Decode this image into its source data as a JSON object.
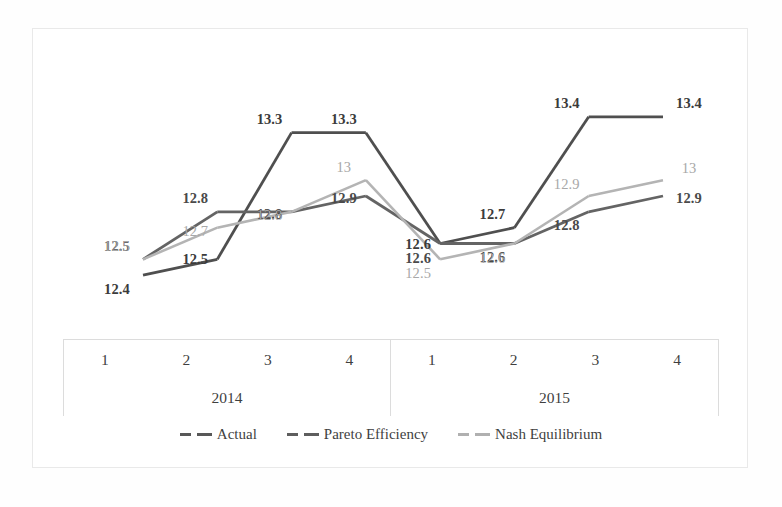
{
  "chart_data": {
    "type": "line",
    "title": "",
    "subtitle": "",
    "xlabel": "",
    "ylabel": "",
    "grid": false,
    "legend_position": "bottom",
    "categories": [
      "1",
      "2",
      "3",
      "4",
      "1",
      "2",
      "3",
      "4"
    ],
    "groups": [
      {
        "label": "2014",
        "quarters": [
          "1",
          "2",
          "3",
          "4"
        ]
      },
      {
        "label": "2015",
        "quarters": [
          "1",
          "2",
          "3",
          "4"
        ]
      }
    ],
    "ylim": [
      12.3,
      13.5
    ],
    "series": [
      {
        "name": "Actual",
        "color": "#4f4f4f",
        "values": [
          12.4,
          12.5,
          13.3,
          13.3,
          12.6,
          12.7,
          13.4,
          13.4
        ],
        "labels": [
          "12.4",
          "12.5",
          "13.3",
          "13.3",
          "12.6",
          "12.7",
          "13.4",
          "13.4"
        ]
      },
      {
        "name": "Pareto Efficiency",
        "color": "#646464",
        "values": [
          12.5,
          12.8,
          12.8,
          12.9,
          12.6,
          12.6,
          12.8,
          12.9
        ],
        "labels": [
          "12.5",
          "12.8",
          "12.8",
          "12.9",
          "12.6",
          "12.6",
          "12.8",
          "12.9"
        ]
      },
      {
        "name": "Nash Equilibrium",
        "color": "#b4b4b4",
        "values": [
          12.5,
          12.7,
          12.8,
          13.0,
          12.5,
          12.6,
          12.9,
          13.0
        ],
        "labels": [
          "12.5",
          "12.7",
          "12.8",
          "13",
          "12.5",
          "12.6",
          "12.9",
          "13"
        ]
      }
    ]
  },
  "legend": {
    "items": [
      {
        "label": "Actual"
      },
      {
        "label": "Pareto Efficiency"
      },
      {
        "label": "Nash Equilibrium"
      }
    ]
  },
  "axis": {
    "group_0_label": "2014",
    "group_1_label": "2015",
    "q1": "1",
    "q2": "2",
    "q3": "3",
    "q4": "4",
    "r1": "1",
    "r2": "2",
    "r3": "3",
    "r4": "4"
  }
}
